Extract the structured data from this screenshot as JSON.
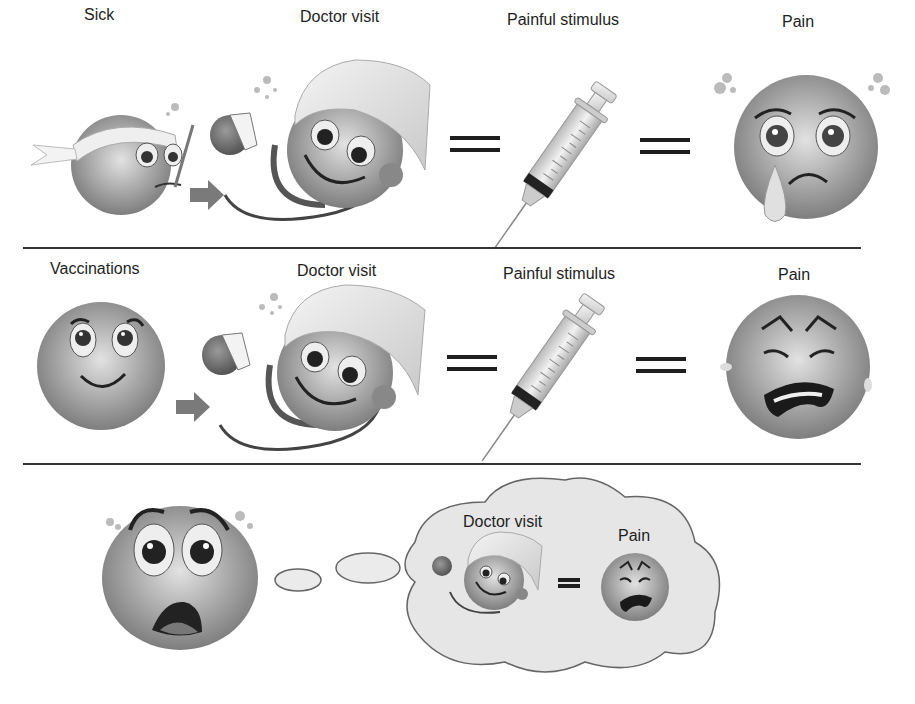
{
  "rows": [
    {
      "labels": {
        "start": "Sick",
        "doctor": "Doctor visit",
        "stimulus": "Painful stimulus",
        "result": "Pain"
      }
    },
    {
      "labels": {
        "start": "Vaccinations",
        "doctor": "Doctor visit",
        "stimulus": "Painful stimulus",
        "result": "Pain"
      }
    }
  ],
  "thought": {
    "doctor_label": "Doctor visit",
    "pain_label": "Pain"
  },
  "colors": {
    "face": "#9a9a9a",
    "face_highlight": "#d8d8d8",
    "line": "#333333",
    "cloud_fill": "#e6e6e6",
    "arrow": "#7a7a7a"
  }
}
